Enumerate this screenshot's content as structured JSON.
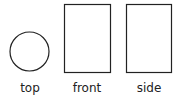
{
  "views": [
    {
      "label": "top",
      "shape": "circle"
    },
    {
      "label": "front",
      "shape": "rectangle"
    },
    {
      "label": "side",
      "shape": "rectangle"
    }
  ],
  "stroke_color": "#222222"
}
